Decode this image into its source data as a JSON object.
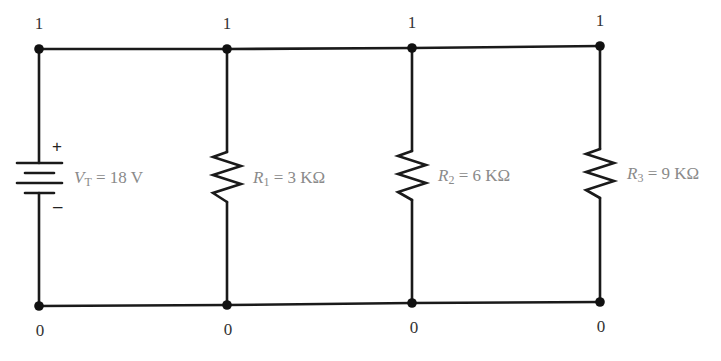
{
  "diagram": {
    "type": "parallel-resistor-circuit",
    "colors": {
      "wire": "#1a1a1a",
      "label": "#8a8a8a",
      "node_label": "#333333"
    },
    "top_node_labels": [
      "1",
      "1",
      "1",
      "1"
    ],
    "bottom_node_labels": [
      "0",
      "0",
      "0",
      "0"
    ],
    "source": {
      "symbol": "V",
      "subscript": "T",
      "value": "= 18 V",
      "plus": "+",
      "minus": "–"
    },
    "resistors": [
      {
        "symbol": "R",
        "subscript": "1",
        "value": "= 3 KΩ"
      },
      {
        "symbol": "R",
        "subscript": "2",
        "value": "= 6 KΩ"
      },
      {
        "symbol": "R",
        "subscript": "3",
        "value": "= 9 KΩ"
      }
    ]
  }
}
